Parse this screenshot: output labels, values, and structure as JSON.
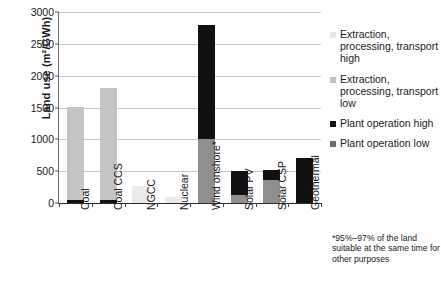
{
  "chart_data": {
    "type": "bar",
    "title": "",
    "xlabel": "",
    "ylabel": "Land use (m²/GWh)",
    "ylim": [
      0,
      3000
    ],
    "yticks": [
      0,
      500,
      1000,
      1500,
      2000,
      2500,
      3000
    ],
    "ytick_labels": [
      "0",
      "500",
      "1000",
      "1500",
      "2000",
      "2500",
      "3000"
    ],
    "grid": true,
    "stacked": true,
    "legend_position": "right",
    "categories": [
      "Coal",
      "Coal CCS",
      "NGCC",
      "Nuclear",
      "Wind onshore*",
      "Solar PV",
      "Solar CSP",
      "Geothermal"
    ],
    "series": [
      {
        "name": "Extraction, processing, transport high",
        "color": "#eaeaea",
        "values": [
          0,
          0,
          265,
          90,
          0,
          0,
          0,
          0
        ]
      },
      {
        "name": "Extraction, processing, transport low",
        "color": "#c5c5c5",
        "values": [
          1470,
          1765,
          0,
          0,
          0,
          0,
          0,
          0
        ]
      },
      {
        "name": "Plant operation high",
        "color": "#111111",
        "values": [
          40,
          40,
          0,
          0,
          1790,
          370,
          160,
          710
        ]
      },
      {
        "name": "Plant operation low",
        "color": "#8f8f8f",
        "values": [
          0,
          0,
          0,
          0,
          1000,
          130,
          360,
          0
        ]
      }
    ],
    "annotations": [
      "*95%–97% of the land suitable at the same time for other purposes"
    ]
  },
  "axis": {
    "y_title": "Land use (m²/GWh)",
    "y_ticks": [
      "3000",
      "2500",
      "2000",
      "1500",
      "1000",
      "500",
      "0"
    ]
  },
  "legend": {
    "items": [
      {
        "label": "Extraction, processing, transport high",
        "swatch": "legend-swatch-ep-high"
      },
      {
        "label": "Extraction, processing, transport low",
        "swatch": "legend-swatch-ep-low"
      },
      {
        "label": "Plant operation high",
        "swatch": "legend-swatch-op-high"
      },
      {
        "label": "Plant operation low",
        "swatch": "legend-swatch-op-low"
      }
    ]
  },
  "footnote": {
    "text": "*95%–97% of the land suitable at the same time for other purposes"
  },
  "colors": {
    "ep_high": "#eaeaea",
    "ep_low": "#c5c5c5",
    "op_high": "#111111",
    "op_low": "#8f8f8f",
    "gridline": "#c9c9c9",
    "axis": "#2b2b2b"
  }
}
